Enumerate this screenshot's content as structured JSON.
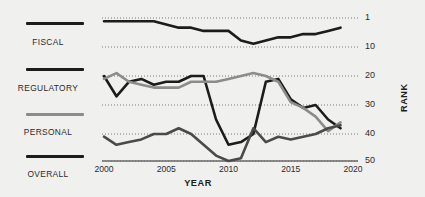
{
  "chart_data": {
    "type": "line",
    "title": "",
    "xlabel": "YEAR",
    "ylabel": "RANK",
    "x": [
      2000,
      2001,
      2002,
      2003,
      2004,
      2005,
      2006,
      2007,
      2008,
      2009,
      2010,
      2011,
      2012,
      2013,
      2014,
      2015,
      2016,
      2017,
      2018,
      2019
    ],
    "xlim": [
      2000,
      2020
    ],
    "ylim": [
      1,
      50
    ],
    "y_inverted": true,
    "xticks": [
      "2000",
      "2005",
      "2010",
      "2015",
      "2020"
    ],
    "xtick_values": [
      2000,
      2005,
      2010,
      2015,
      2020
    ],
    "yticks": [
      "1",
      "10",
      "20",
      "30",
      "40",
      "50"
    ],
    "ytick_values": [
      1,
      10,
      20,
      30,
      40,
      50
    ],
    "grid": "horizontal-dotted",
    "legend_position": "left",
    "series": [
      {
        "name": "FISCAL",
        "color": "#1c1c1c",
        "width": 2.6,
        "values": [
          2,
          2,
          2,
          2,
          2,
          3,
          4,
          4,
          5,
          5,
          5,
          8,
          9,
          8,
          7,
          7,
          6,
          6,
          5,
          4
        ]
      },
      {
        "name": "REGULATORY",
        "color": "#1c1c1c",
        "width": 2.6,
        "values": [
          20,
          27,
          22,
          21,
          23,
          22,
          22,
          20,
          20,
          35,
          44,
          43,
          40,
          22,
          21,
          28,
          31,
          30,
          35,
          38
        ]
      },
      {
        "name": "PERSONAL",
        "color": "#8c8c8c",
        "width": 2.6,
        "values": [
          21,
          19,
          22,
          23,
          24,
          24,
          24,
          22,
          22,
          22,
          21,
          20,
          19,
          20,
          22,
          29,
          31,
          34,
          39,
          36
        ]
      },
      {
        "name": "OVERALL",
        "color": "#4a4a4a",
        "width": 2.6,
        "values": [
          41,
          44,
          43,
          42,
          40,
          40,
          38,
          40,
          44,
          48,
          50,
          49,
          38,
          43,
          41,
          42,
          41,
          40,
          38,
          37
        ]
      }
    ]
  },
  "legend": {
    "items": [
      {
        "label": "FISCAL",
        "color": "#1c1c1c"
      },
      {
        "label": "REGULATORY",
        "color": "#1c1c1c"
      },
      {
        "label": "PERSONAL",
        "color": "#8c8c8c"
      },
      {
        "label": "OVERALL",
        "color": "#1c1c1c"
      }
    ]
  },
  "axes": {
    "y_title": "RANK",
    "x_title": "YEAR"
  },
  "colors": {
    "background": "#f0f0ef",
    "text": "#2b2b2b",
    "grid": "#6e6e6e",
    "baseline": "#6a6a6a"
  }
}
